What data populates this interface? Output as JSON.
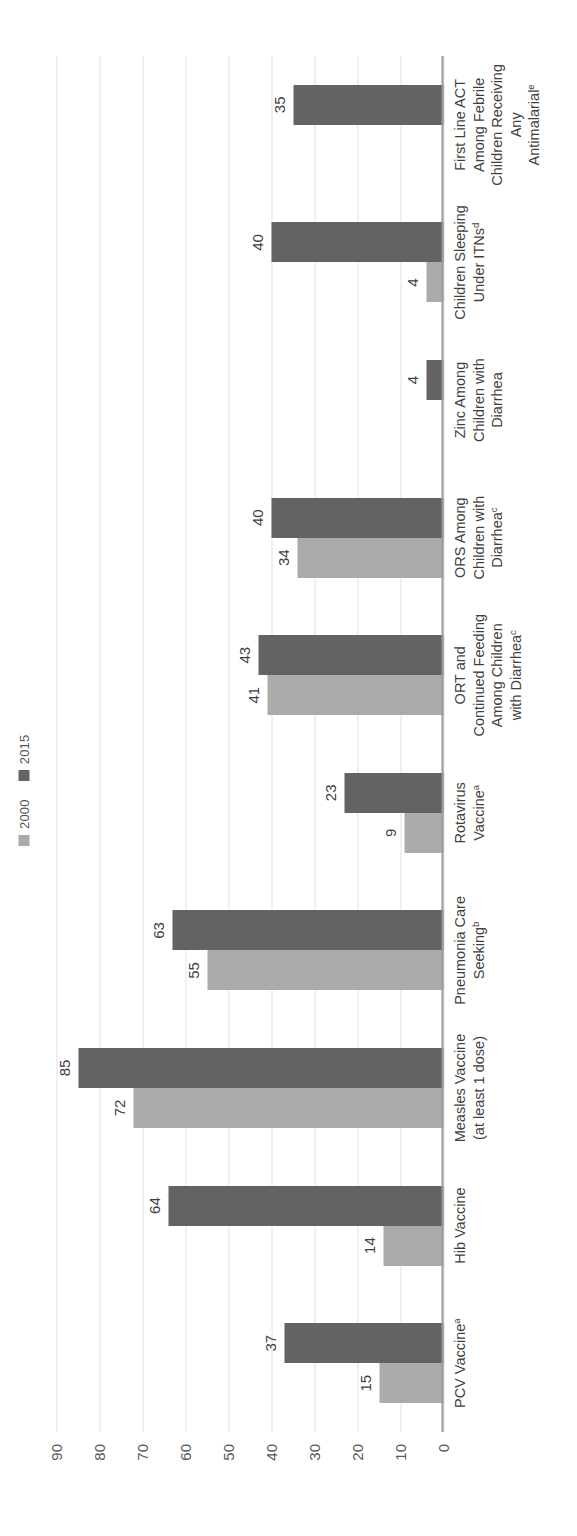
{
  "chart_data": {
    "type": "bar",
    "title": "",
    "subtitle": "",
    "xlabel": "",
    "ylabel": "",
    "ylim": [
      0,
      90
    ],
    "yticks": [
      "0",
      "10",
      "20",
      "30",
      "40",
      "50",
      "60",
      "70",
      "80",
      "90"
    ],
    "grid": true,
    "orientation": "vertical-bars-rotated-90ccw",
    "legend_position": "top-left",
    "categories": [
      "PCV Vaccineᵃ",
      "Hib Vaccine",
      "Measles Vaccine (at least 1 dose)",
      "Pneumonia Care Seekingᵇ",
      "Rotavirus Vaccineᵃ",
      "ORT and Continued Feeding Among Children with Diarrheaᶜ",
      "ORS Among Children with Diarrheaᶜ",
      "Zinc Among Children with Diarrhea",
      "Children Sleeping Under ITNsᵈ",
      "First Line ACT Among Febrile Children Receiving Any Antimalarialᵉ"
    ],
    "category_lines": [
      [
        "PCV Vaccine",
        "a"
      ],
      [
        "Hib Vaccine",
        ""
      ],
      [
        "Measles Vaccine",
        "",
        "(at least 1 dose)"
      ],
      [
        "Pneumonia Care",
        "",
        "Seeking",
        "b"
      ],
      [
        "Rotavirus",
        "",
        "Vaccine",
        "a"
      ],
      [
        "ORT and",
        "Continued Feeding",
        "Among Children",
        "with Diarrhea",
        "c"
      ],
      [
        "ORS Among",
        "Children with",
        "Diarrhea",
        "c"
      ],
      [
        "Zinc Among",
        "Children with",
        "Diarrhea",
        ""
      ],
      [
        "Children Sleeping",
        "Under ITNs",
        "d"
      ],
      [
        "First Line ACT",
        "Among Febrile",
        "Children Receiving",
        "Any",
        "Antimalarial",
        "e"
      ]
    ],
    "series": [
      {
        "name": "2000",
        "color": "#ababab",
        "values": [
          15,
          14,
          72,
          55,
          9,
          41,
          34,
          null,
          4,
          null
        ],
        "labels": [
          "15",
          "14",
          "72",
          "55",
          "9",
          "41",
          "34",
          "",
          "4",
          ""
        ]
      },
      {
        "name": "2015",
        "color": "#636363",
        "values": [
          37,
          64,
          85,
          63,
          23,
          43,
          40,
          4,
          40,
          35
        ],
        "labels": [
          "37",
          "64",
          "85",
          "63",
          "23",
          "43",
          "40",
          "4",
          "40",
          "35"
        ]
      }
    ]
  },
  "legend": {
    "items": [
      {
        "label": "2000",
        "color": "#ababab"
      },
      {
        "label": "2015",
        "color": "#636363"
      }
    ]
  },
  "categories_html": [
    "PCV Vaccine<sup>a</sup>",
    "Hib Vaccine",
    "Measles Vaccine<br>(at least 1 dose)",
    "Pneumonia Care<br>Seeking<sup>b</sup>",
    "Rotavirus<br>Vaccine<sup>a</sup>",
    "ORT and<br>Continued Feeding<br>Among Children<br>with Diarrhea<sup>c</sup>",
    "ORS Among<br>Children with<br>Diarrhea<sup>c</sup>",
    "Zinc Among<br>Children with<br>Diarrhea",
    "Children Sleeping<br>Under ITNs<sup>d</sup>",
    "First Line ACT<br>Among Febrile<br>Children Receiving<br>Any<br>Antimalarial<sup>e</sup>"
  ],
  "colors": {
    "series_2000": "#ababab",
    "series_2015": "#636363",
    "gridline": "#e2e2e2",
    "axis": "#9a9a9a",
    "text": "#3f3f3f",
    "background": "#ffffff"
  }
}
